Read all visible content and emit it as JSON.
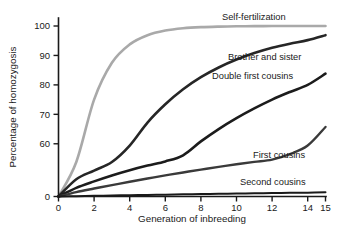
{
  "chart_data": {
    "type": "line",
    "title": "",
    "xlabel": "Generation of inbreeding",
    "ylabel": "Percentage of homozygosis",
    "xlim": [
      0,
      15
    ],
    "ylim": [
      0,
      100
    ],
    "y_axis_note": "broken axis: 0 then 55-100 linear",
    "grid": false,
    "legend": "inline curve labels at right",
    "xticks": [
      "0",
      "2",
      "4",
      "6",
      "8",
      "10",
      "12",
      "14",
      "15"
    ],
    "xtick_values": [
      0,
      2,
      4,
      6,
      8,
      10,
      12,
      14,
      15
    ],
    "yticks": [
      "0",
      "60",
      "70",
      "80",
      "90",
      "100"
    ],
    "ytick_values": [
      0,
      60,
      70,
      80,
      90,
      100
    ],
    "x": [
      0,
      1,
      2,
      3,
      4,
      5,
      6,
      7,
      8,
      9,
      10,
      11,
      12,
      13,
      14,
      15
    ],
    "series": [
      {
        "name": "Self-fertilization",
        "label": "Self-fertilization",
        "color": "#a9a9a9",
        "width": 2.6,
        "values": [
          0,
          50.0,
          75.0,
          87.5,
          93.75,
          96.88,
          98.44,
          99.22,
          99.61,
          99.8,
          99.9,
          99.95,
          99.98,
          99.99,
          99.99,
          99.99
        ]
      },
      {
        "name": "Brother and sister",
        "label": "Brother and sister",
        "color": "#262626",
        "width": 2.6,
        "values": [
          0,
          25.0,
          37.5,
          50.0,
          59.4,
          67.2,
          73.4,
          78.5,
          82.6,
          85.9,
          88.6,
          90.8,
          92.6,
          94.0,
          95.2,
          96.9
        ]
      },
      {
        "name": "Double first cousins",
        "label": "Double first cousins",
        "color": "#1c1c1c",
        "width": 2.6,
        "values": [
          0,
          12.5,
          21.9,
          30.5,
          38.1,
          44.8,
          50.8,
          56.1,
          60.8,
          65.0,
          68.7,
          72.0,
          75.0,
          77.6,
          80.0,
          83.8
        ]
      },
      {
        "name": "First cousins",
        "label": "First cousins",
        "color": "#3a3a3a",
        "width": 2.4,
        "values": [
          0,
          6.3,
          11.5,
          16.5,
          21.4,
          26.0,
          30.5,
          34.8,
          38.9,
          42.8,
          46.6,
          50.1,
          53.4,
          56.5,
          59.4,
          65.7
        ]
      },
      {
        "name": "Second cousins",
        "label": "Second cousins",
        "color": "#1a1a1a",
        "width": 2.0,
        "values": [
          0,
          0.5,
          1.0,
          1.4,
          1.9,
          2.3,
          2.7,
          3.1,
          3.5,
          3.9,
          4.2,
          4.6,
          4.9,
          5.3,
          5.6,
          6.0
        ]
      }
    ],
    "label_positions": [
      {
        "series": "Self-fertilization",
        "x": 222,
        "y": 20
      },
      {
        "series": "Brother and sister",
        "x": 228,
        "y": 60
      },
      {
        "series": "Double first cousins",
        "x": 212,
        "y": 79
      },
      {
        "series": "First cousins",
        "x": 253,
        "y": 158
      },
      {
        "series": "Second cousins",
        "x": 240,
        "y": 185
      }
    ]
  }
}
